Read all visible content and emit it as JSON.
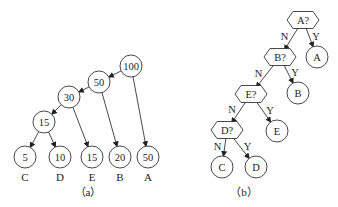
{
  "figure_a": {
    "caption": "（a）",
    "internal_nodes": [
      {
        "id": "n100",
        "value": "100",
        "cx": 131,
        "cy": 66
      },
      {
        "id": "n50",
        "value": "50",
        "cx": 99,
        "cy": 82
      },
      {
        "id": "n30",
        "value": "30",
        "cx": 69,
        "cy": 97
      },
      {
        "id": "n15",
        "value": "15",
        "cx": 44,
        "cy": 122
      }
    ],
    "leaves": [
      {
        "id": "lC",
        "value": "5",
        "label": "C",
        "cx": 25,
        "cy": 157
      },
      {
        "id": "lD",
        "value": "10",
        "label": "D",
        "cx": 60,
        "cy": 157
      },
      {
        "id": "lE",
        "value": "15",
        "label": "E",
        "cx": 92,
        "cy": 157
      },
      {
        "id": "lB",
        "value": "20",
        "label": "B",
        "cx": 120,
        "cy": 157
      },
      {
        "id": "lA",
        "value": "50",
        "label": "A",
        "cx": 148,
        "cy": 157
      }
    ],
    "edges": [
      [
        "n100",
        "n50"
      ],
      [
        "n100",
        "lA"
      ],
      [
        "n50",
        "n30"
      ],
      [
        "n50",
        "lB"
      ],
      [
        "n30",
        "n15"
      ],
      [
        "n30",
        "lE"
      ],
      [
        "n15",
        "lC"
      ],
      [
        "n15",
        "lD"
      ]
    ]
  },
  "figure_b": {
    "caption": "（b）",
    "decisions": [
      {
        "id": "qA",
        "label": "A?",
        "cx": 303,
        "cy": 20
      },
      {
        "id": "qB",
        "label": "B?",
        "cx": 280,
        "cy": 57
      },
      {
        "id": "qE",
        "label": "E?",
        "cx": 251,
        "cy": 94
      },
      {
        "id": "qD",
        "label": "D?",
        "cx": 227,
        "cy": 130
      }
    ],
    "outcomes": [
      {
        "id": "oA",
        "label": "A",
        "cx": 317,
        "cy": 57
      },
      {
        "id": "oB",
        "label": "B",
        "cx": 298,
        "cy": 93
      },
      {
        "id": "oE",
        "label": "E",
        "cx": 277,
        "cy": 131
      },
      {
        "id": "oC",
        "label": "C",
        "cx": 222,
        "cy": 167
      },
      {
        "id": "oD",
        "label": "D",
        "cx": 256,
        "cy": 167
      }
    ],
    "edges": [
      {
        "from": "qA",
        "to": "qB",
        "label": "N"
      },
      {
        "from": "qA",
        "to": "oA",
        "label": "Y"
      },
      {
        "from": "qB",
        "to": "qE",
        "label": "N"
      },
      {
        "from": "qB",
        "to": "oB",
        "label": "Y"
      },
      {
        "from": "qE",
        "to": "qD",
        "label": "N"
      },
      {
        "from": "qE",
        "to": "oE",
        "label": "Y"
      },
      {
        "from": "qD",
        "to": "oC",
        "label": "N"
      },
      {
        "from": "qD",
        "to": "oD",
        "label": "Y"
      }
    ]
  }
}
